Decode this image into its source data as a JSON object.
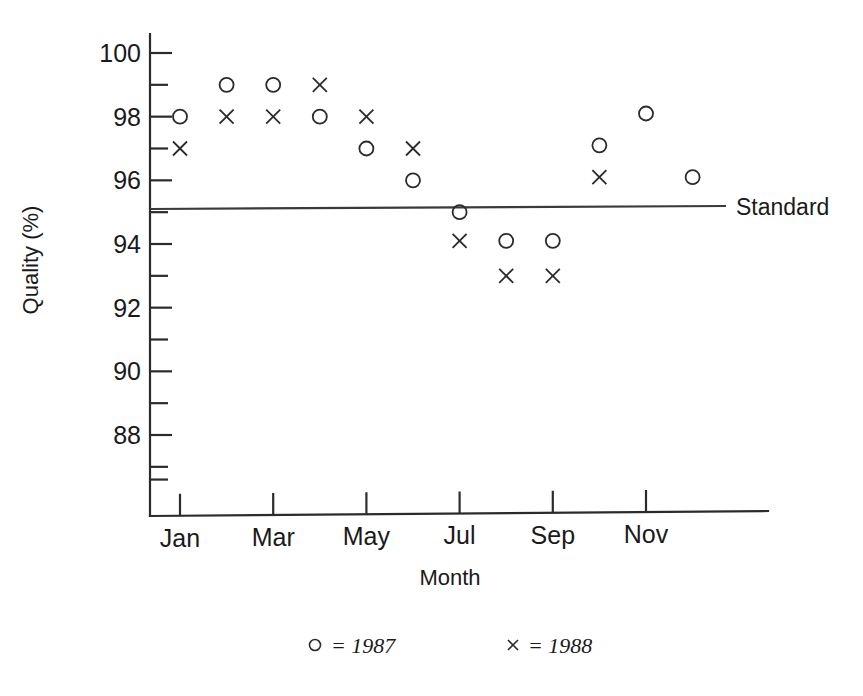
{
  "chart_data": {
    "type": "scatter",
    "title": "",
    "xlabel": "Month",
    "ylabel": "Quality (%)",
    "ylim": [
      86.5,
      100.8
    ],
    "yticks": [
      88,
      90,
      92,
      94,
      96,
      98,
      100
    ],
    "ytick_labels": [
      "88",
      "90",
      "92",
      "94",
      "96",
      "98",
      "100"
    ],
    "yminor_ticks": [
      87,
      89,
      91,
      93,
      95,
      97,
      99
    ],
    "grid": false,
    "legend_position": "below-plot",
    "categories": [
      "Jan",
      "Feb",
      "Mar",
      "Apr",
      "May",
      "Jun",
      "Jul",
      "Aug",
      "Sep",
      "Oct",
      "Nov",
      "Dec"
    ],
    "xtick_labels": [
      "Jan",
      "Mar",
      "May",
      "Jul",
      "Sep",
      "Nov"
    ],
    "xtick_categories": [
      "Jan",
      "Mar",
      "May",
      "Jul",
      "Sep",
      "Nov"
    ],
    "series": [
      {
        "name": "1987",
        "marker": "circle",
        "legend_label": "= 1987",
        "values": [
          98,
          99,
          99,
          98,
          97,
          96,
          95,
          94.1,
          94.1,
          97.1,
          98.1,
          96.1
        ]
      },
      {
        "name": "1988",
        "marker": "cross",
        "legend_label": "= 1988",
        "values": [
          97,
          98,
          98,
          99,
          98,
          97,
          94.1,
          93,
          93,
          96.1,
          null,
          null
        ]
      }
    ],
    "reference_line": {
      "label": "Standard",
      "value": 95
    }
  },
  "colors": {
    "ink": "#1a1a1a",
    "axis": "#2b2b2b",
    "line": "#3a3a3a",
    "background": "#ffffff"
  }
}
